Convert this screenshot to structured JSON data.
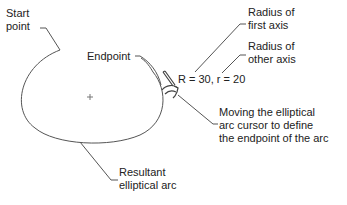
{
  "diagram": {
    "labels": {
      "start_point": [
        "Start",
        "point"
      ],
      "endpoint": "Endpoint",
      "radius_first": [
        "Radius of",
        "first axis"
      ],
      "radius_other": [
        "Radius of",
        "other axis"
      ],
      "radii_value": "R = 30, r = 20",
      "moving_cursor": [
        "Moving the elliptical",
        "arc cursor to define",
        "the endpoint of the arc"
      ],
      "resultant": [
        "Resultant",
        "elliptical arc"
      ]
    },
    "colors": {
      "stroke": "#555555",
      "text": "#222222",
      "background": "#ffffff"
    },
    "center_marker": "+"
  }
}
